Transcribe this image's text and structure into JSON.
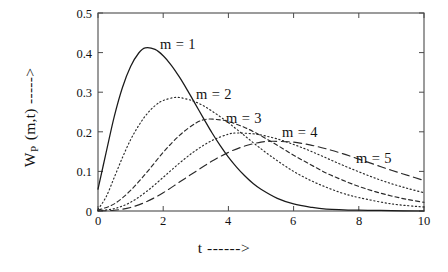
{
  "chart_data": {
    "type": "line",
    "title": "",
    "xlabel": "t ------>",
    "ylabel_main": "W",
    "ylabel_sub": "P",
    "ylabel_rest": " (m,t) ----->",
    "xlim": [
      0,
      10
    ],
    "ylim": [
      0,
      0.5
    ],
    "xticks": [
      0,
      2,
      4,
      6,
      8,
      10
    ],
    "xtick_labels": [
      "0",
      "2",
      "4",
      "6",
      "8",
      "10"
    ],
    "yticks": [
      0,
      0.1,
      0.2,
      0.3,
      0.4,
      0.5
    ],
    "ytick_labels": [
      "0",
      "0.1",
      "0.2",
      "0.3",
      "0.4",
      "0.5"
    ],
    "grid": false,
    "legend_position": "inline-annotations",
    "series": [
      {
        "name": "m = 1",
        "linestyle": "solid",
        "color": "#1a1a1a",
        "peak_t": 1.45,
        "peak_value": 0.412,
        "value_at_t0": 0.055,
        "label_x": 160,
        "label_y": 36,
        "x": [
          0.0,
          0.25,
          0.5,
          0.75,
          1.0,
          1.25,
          1.45,
          1.75,
          2.0,
          2.25,
          2.5,
          2.75,
          3.0,
          3.25,
          3.5,
          3.75,
          4.0,
          4.25,
          4.5,
          4.75,
          5.0,
          5.5,
          6.0,
          6.5,
          7.0,
          8.0,
          9.0,
          10.0
        ],
        "y": [
          0.055,
          0.148,
          0.239,
          0.312,
          0.365,
          0.399,
          0.412,
          0.408,
          0.392,
          0.368,
          0.338,
          0.304,
          0.268,
          0.232,
          0.197,
          0.165,
          0.136,
          0.111,
          0.089,
          0.07,
          0.055,
          0.032,
          0.018,
          0.01,
          0.005,
          0.002,
          0.001,
          0.0
        ]
      },
      {
        "name": "m = 2",
        "linestyle": "dotted",
        "color": "#2a2a2a",
        "peak_t": 2.4,
        "peak_value": 0.287,
        "value_at_t0": 0.004,
        "label_x": 196,
        "label_y": 86,
        "x": [
          0.0,
          0.25,
          0.5,
          0.75,
          1.0,
          1.25,
          1.5,
          1.75,
          2.0,
          2.4,
          2.75,
          3.0,
          3.25,
          3.5,
          3.75,
          4.0,
          4.5,
          5.0,
          5.5,
          6.0,
          6.5,
          7.0,
          7.5,
          8.0,
          9.0,
          10.0
        ],
        "y": [
          0.004,
          0.036,
          0.085,
          0.135,
          0.18,
          0.216,
          0.245,
          0.266,
          0.279,
          0.287,
          0.282,
          0.275,
          0.265,
          0.252,
          0.238,
          0.223,
          0.19,
          0.157,
          0.127,
          0.1,
          0.078,
          0.06,
          0.045,
          0.034,
          0.018,
          0.01
        ]
      },
      {
        "name": "m = 3",
        "linestyle": "dashed",
        "color": "#2a2a2a",
        "peak_t": 3.35,
        "peak_value": 0.232,
        "value_at_t0": 0.002,
        "label_x": 226,
        "label_y": 110,
        "x": [
          0.0,
          0.5,
          1.0,
          1.5,
          2.0,
          2.5,
          3.0,
          3.35,
          3.75,
          4.0,
          4.5,
          5.0,
          5.5,
          6.0,
          6.5,
          7.0,
          7.5,
          8.0,
          8.5,
          9.0,
          9.5,
          10.0
        ],
        "y": [
          0.002,
          0.018,
          0.052,
          0.098,
          0.148,
          0.191,
          0.222,
          0.232,
          0.23,
          0.226,
          0.211,
          0.19,
          0.166,
          0.141,
          0.118,
          0.096,
          0.078,
          0.062,
          0.049,
          0.038,
          0.029,
          0.022
        ]
      },
      {
        "name": "m = 4",
        "linestyle": "dotted",
        "color": "#2a2a2a",
        "peak_t": 4.3,
        "peak_value": 0.197,
        "value_at_t0": 0.001,
        "label_x": 282,
        "label_y": 124,
        "x": [
          0.0,
          0.5,
          1.0,
          1.5,
          2.0,
          2.5,
          3.0,
          3.5,
          4.0,
          4.3,
          4.75,
          5.0,
          5.5,
          6.0,
          6.5,
          7.0,
          7.5,
          8.0,
          8.5,
          9.0,
          9.5,
          10.0
        ],
        "y": [
          0.001,
          0.006,
          0.022,
          0.05,
          0.085,
          0.121,
          0.153,
          0.178,
          0.194,
          0.197,
          0.195,
          0.192,
          0.182,
          0.168,
          0.152,
          0.134,
          0.116,
          0.099,
          0.083,
          0.069,
          0.057,
          0.046
        ]
      },
      {
        "name": "m = 5",
        "linestyle": "longdash",
        "color": "#2a2a2a",
        "peak_t": 5.35,
        "peak_value": 0.176,
        "value_at_t0": 0.0,
        "label_x": 356,
        "label_y": 150,
        "x": [
          0.0,
          0.5,
          1.0,
          1.5,
          2.0,
          2.5,
          3.0,
          3.5,
          4.0,
          4.5,
          5.0,
          5.35,
          5.75,
          6.0,
          6.5,
          7.0,
          7.5,
          8.0,
          8.5,
          9.0,
          9.5,
          10.0
        ],
        "y": [
          0.0,
          0.002,
          0.009,
          0.024,
          0.046,
          0.073,
          0.1,
          0.126,
          0.148,
          0.164,
          0.174,
          0.176,
          0.175,
          0.174,
          0.167,
          0.157,
          0.145,
          0.131,
          0.117,
          0.103,
          0.09,
          0.077
        ]
      }
    ]
  }
}
